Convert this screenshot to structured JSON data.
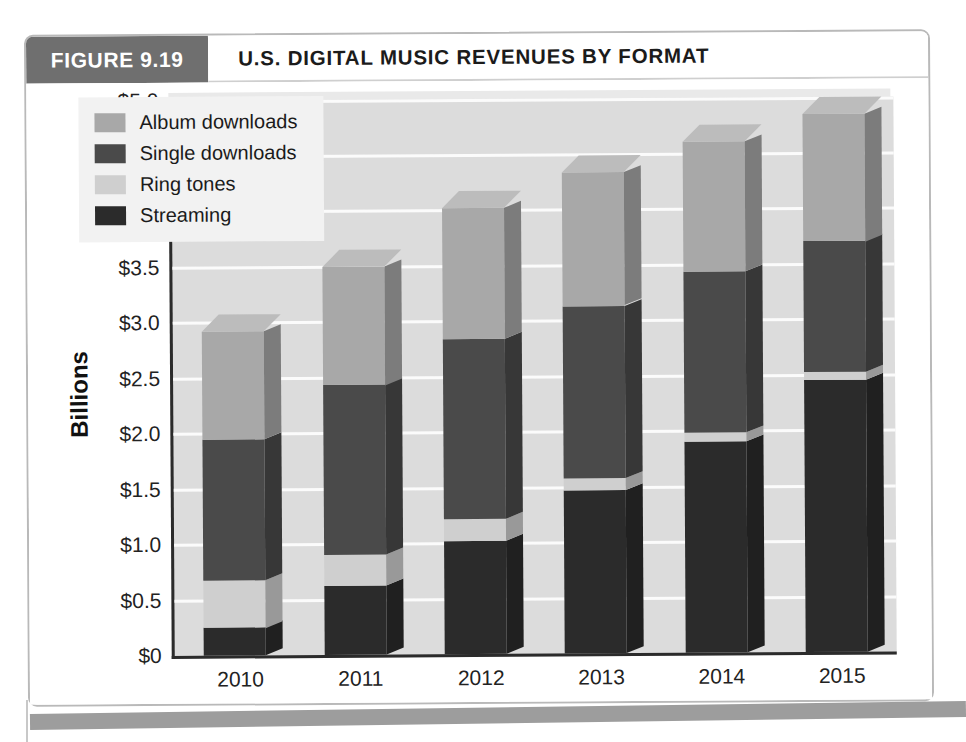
{
  "figure": {
    "tag": "FIGURE 9.19",
    "title": "U.S. DIGITAL MUSIC REVENUES BY FORMAT"
  },
  "colors": {
    "album_downloads": "#a8a8a8",
    "single_downloads": "#4a4a4a",
    "ring_tones": "#cfcfcf",
    "streaming": "#2b2b2b",
    "plot_background": "#dcdcdc",
    "gridline": "#fbfbfb",
    "axis": "#2b2b2b",
    "header_tag_background": "#6f6f6f",
    "page_rule": "#9d9d9d"
  },
  "legend": {
    "position": "top-left",
    "items": [
      {
        "label": "Album downloads",
        "color": "#a8a8a8"
      },
      {
        "label": "Single downloads",
        "color": "#4a4a4a"
      },
      {
        "label": "Ring tones",
        "color": "#cfcfcf"
      },
      {
        "label": "Streaming",
        "color": "#2b2b2b"
      }
    ]
  },
  "chart_data": {
    "type": "bar",
    "stacked": true,
    "three_d": true,
    "title": "U.S. DIGITAL MUSIC REVENUES BY FORMAT",
    "xlabel": "",
    "ylabel": "Billions",
    "categories": [
      "2010",
      "2011",
      "2012",
      "2013",
      "2014",
      "2015"
    ],
    "ylim": [
      0,
      5.0
    ],
    "ytick_step": 0.5,
    "ytick_labels": [
      "$5.0",
      "$4.5",
      "$4.0",
      "$3.5",
      "$3.0",
      "$2.5",
      "$2.0",
      "$1.5",
      "$1.0",
      "$0.5",
      "$0"
    ],
    "ytick_values": [
      5.0,
      4.5,
      4.0,
      3.5,
      3.0,
      2.5,
      2.0,
      1.5,
      1.0,
      0.5,
      0
    ],
    "grid": true,
    "grid_axis": "y",
    "units": "Billions of U.S. dollars",
    "stack_order_bottom_to_top": [
      "Streaming",
      "Ring tones",
      "Single downloads",
      "Album downloads"
    ],
    "series": [
      {
        "name": "Streaming",
        "color": "#2b2b2b",
        "values": [
          0.25,
          0.62,
          1.02,
          1.47,
          1.9,
          2.45
        ]
      },
      {
        "name": "Ring tones",
        "color": "#cfcfcf",
        "values": [
          0.43,
          0.28,
          0.2,
          0.11,
          0.08,
          0.07
        ]
      },
      {
        "name": "Single downloads",
        "color": "#4a4a4a",
        "values": [
          1.27,
          1.53,
          1.62,
          1.55,
          1.45,
          1.18
        ]
      },
      {
        "name": "Album downloads",
        "color": "#a8a8a8",
        "values": [
          0.97,
          1.07,
          1.18,
          1.2,
          1.17,
          1.15
        ]
      }
    ],
    "totals": [
      2.92,
      3.5,
      4.02,
      4.33,
      4.6,
      4.85
    ]
  }
}
